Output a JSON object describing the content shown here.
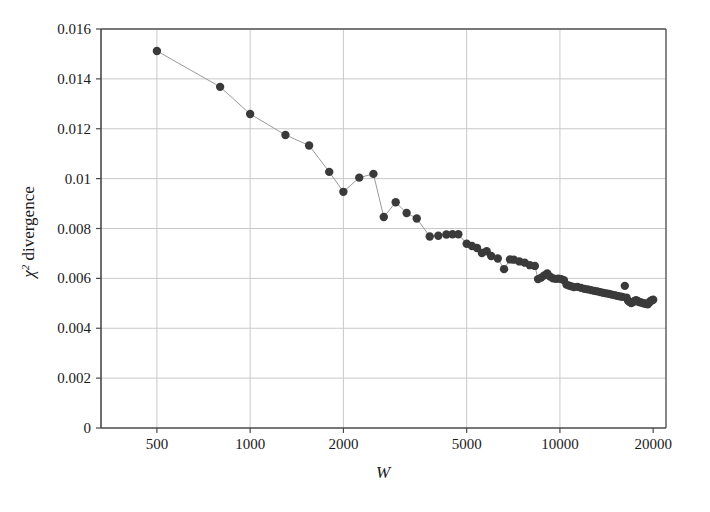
{
  "chart_data": {
    "type": "scatter",
    "title": "",
    "subtitle": "",
    "xlabel": "W",
    "ylabel": "χ² divergence",
    "ylabel_parts": {
      "symbol": "χ",
      "exponent": "2",
      "text": " divergence"
    },
    "xscale": "log",
    "yscale": "linear",
    "xlim": [
      330,
      22000
    ],
    "ylim": [
      0,
      0.016
    ],
    "grid": true,
    "legend": null,
    "legend_position": "none",
    "marker_color": "#3a3a3a",
    "line_color": "#9a9a9a",
    "axis_color": "#555555",
    "grid_color": "#c9c9c9",
    "marker_size": 6,
    "connect_line_through_point": 40,
    "xticks": [
      500,
      1000,
      2000,
      5000,
      10000,
      20000
    ],
    "xtick_labels": [
      "500",
      "1000",
      "2000",
      "5000",
      "10000",
      "20000"
    ],
    "yticks": [
      0,
      0.002,
      0.004,
      0.006,
      0.008,
      0.01,
      0.012,
      0.014,
      0.016
    ],
    "ytick_labels": [
      "0",
      "0.002",
      "0.004",
      "0.006",
      "0.008",
      "0.01",
      "0.012",
      "0.014",
      "0.016"
    ],
    "points": [
      [
        500,
        0.01512
      ],
      [
        800,
        0.01368
      ],
      [
        1000,
        0.01259
      ],
      [
        1300,
        0.01175
      ],
      [
        1550,
        0.01133
      ],
      [
        1800,
        0.01027
      ],
      [
        2000,
        0.00947
      ],
      [
        2250,
        0.01004
      ],
      [
        2500,
        0.01019
      ],
      [
        2700,
        0.00846
      ],
      [
        2950,
        0.00905
      ],
      [
        3200,
        0.00862
      ],
      [
        3450,
        0.0084
      ],
      [
        3800,
        0.00768
      ],
      [
        4050,
        0.00771
      ],
      [
        4300,
        0.00776
      ],
      [
        4500,
        0.00777
      ],
      [
        4700,
        0.00777
      ],
      [
        5000,
        0.00739
      ],
      [
        5200,
        0.0073
      ],
      [
        5400,
        0.00722
      ],
      [
        5600,
        0.00702
      ],
      [
        5800,
        0.00709
      ],
      [
        6000,
        0.0069
      ],
      [
        6300,
        0.0068
      ],
      [
        6600,
        0.00637
      ],
      [
        6900,
        0.00676
      ],
      [
        7100,
        0.00675
      ],
      [
        7400,
        0.00668
      ],
      [
        7700,
        0.00663
      ],
      [
        8000,
        0.00653
      ],
      [
        8300,
        0.0065
      ],
      [
        8500,
        0.00597
      ],
      [
        8700,
        0.00603
      ],
      [
        8900,
        0.00612
      ],
      [
        9100,
        0.0062
      ],
      [
        9300,
        0.00607
      ],
      [
        9500,
        0.006
      ],
      [
        9700,
        0.00598
      ],
      [
        9900,
        0.00599
      ],
      [
        10100,
        0.00597
      ],
      [
        10300,
        0.00593
      ],
      [
        10500,
        0.00575
      ],
      [
        10700,
        0.00571
      ],
      [
        10900,
        0.00568
      ],
      [
        11100,
        0.00565
      ],
      [
        11400,
        0.00566
      ],
      [
        11700,
        0.00562
      ],
      [
        12000,
        0.00558
      ],
      [
        12300,
        0.00556
      ],
      [
        12600,
        0.00553
      ],
      [
        12900,
        0.0055
      ],
      [
        13200,
        0.00548
      ],
      [
        13500,
        0.00545
      ],
      [
        13800,
        0.00542
      ],
      [
        14100,
        0.0054
      ],
      [
        14400,
        0.00538
      ],
      [
        14700,
        0.00535
      ],
      [
        15000,
        0.00533
      ],
      [
        15300,
        0.0053
      ],
      [
        15600,
        0.00528
      ],
      [
        15900,
        0.00526
      ],
      [
        16200,
        0.0057
      ],
      [
        16400,
        0.00523
      ],
      [
        16600,
        0.0051
      ],
      [
        16800,
        0.00505
      ],
      [
        17000,
        0.00501
      ],
      [
        17200,
        0.00505
      ],
      [
        17400,
        0.00508
      ],
      [
        17600,
        0.00512
      ],
      [
        17800,
        0.00509
      ],
      [
        18000,
        0.00505
      ],
      [
        18300,
        0.00503
      ],
      [
        18600,
        0.005
      ],
      [
        18900,
        0.00498
      ],
      [
        19200,
        0.00496
      ],
      [
        19400,
        0.00502
      ],
      [
        19600,
        0.00508
      ],
      [
        19800,
        0.00512
      ],
      [
        20000,
        0.00514
      ]
    ]
  }
}
